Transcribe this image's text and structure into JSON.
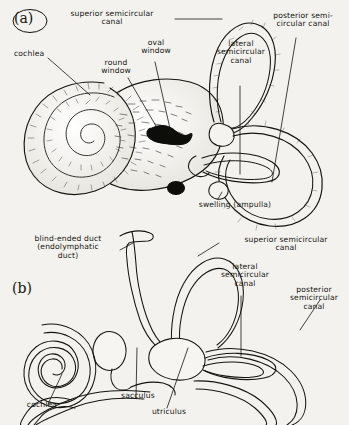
{
  "figure": {
    "background_color": "#f3f2ee",
    "ink_color": "#15150f",
    "panels": [
      {
        "mark": "(a)",
        "mark_circled": true,
        "description": "bony labyrinth, shaded pen drawing"
      },
      {
        "mark": "(b)",
        "mark_circled": false,
        "description": "membranous labyrinth, line drawing"
      }
    ]
  },
  "panel_a": {
    "mark": "(a)",
    "labels": {
      "superior_semicircular_canal": "superior semicircular\ncanal",
      "posterior_semicircular_canal": "posterior semi-\ncircular canal",
      "cochlea": "cochlea",
      "oval_window": "oval\nwindow",
      "round_window": "round\nwindow",
      "lateral_semicircular_canal": "lateral\nsemicircular\ncanal",
      "swelling_ampulla": "swelling (ampulla)"
    }
  },
  "panel_b": {
    "mark": "(b)",
    "labels": {
      "blind_ended_duct": "blind-ended duct\n(endolymphatic\nduct)",
      "superior_semicircular_canal": "superior semicircular\ncanal",
      "lateral_semicircular_canal": "lateral\nsemicircular\ncanal",
      "posterior_semicircular_canal": "posterior\nsemicircular\ncanal",
      "cochlea": "cochlea",
      "sacculus": "sacculus",
      "utriculus": "utriculus"
    }
  }
}
